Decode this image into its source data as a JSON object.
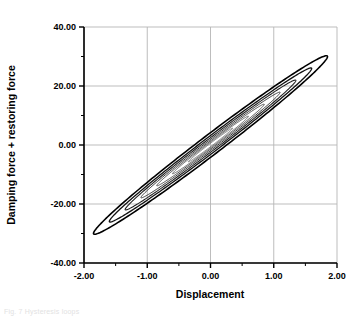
{
  "figure": {
    "background_color": "#ffffff",
    "frame_color": "#000000",
    "grid_color": "#b5b5b5",
    "curve_color": "#000000",
    "caption_fragment": "Fig. 7  Hysteresis loops"
  },
  "chart_data": {
    "type": "line",
    "title": "",
    "xlabel": "Displacement",
    "ylabel": "Damping force + restoring force",
    "xlim": [
      -2.0,
      2.0
    ],
    "ylim": [
      -40.0,
      40.0
    ],
    "xticks": [
      -2.0,
      -1.0,
      0.0,
      1.0,
      2.0
    ],
    "xtick_labels": [
      "-2.00",
      "-1.00",
      "0.00",
      "1.00",
      "2.00"
    ],
    "yticks": [
      -40.0,
      -20.0,
      0.0,
      20.0,
      40.0
    ],
    "ytick_labels": [
      "-40.00",
      "-20.00",
      "0.00",
      "20.00",
      "40.00"
    ],
    "x_minor_tick_interval": 0.5,
    "y_minor_tick_interval": 10.0,
    "grid": true,
    "grid_axes": "both",
    "legend": null,
    "legend_position": "none",
    "annotations": [],
    "series": [
      {
        "name": "loop-1-outer",
        "type": "hysteresis-ellipse",
        "amplitude_x": 1.85,
        "amplitude_y": 30.0,
        "slope": 16.2,
        "half_width_y_at_zero": 4.2,
        "tilt_deg": 0,
        "linewidth": 1.6,
        "color": "#000000",
        "endpoints": [
          [
            -1.85,
            -30.0
          ],
          [
            1.85,
            30.0
          ]
        ]
      },
      {
        "name": "loop-2",
        "type": "hysteresis-ellipse",
        "amplitude_x": 1.6,
        "amplitude_y": 26.0,
        "slope": 16.2,
        "half_width_y_at_zero": 3.2,
        "tilt_deg": 0,
        "linewidth": 1.3,
        "color": "#111111",
        "endpoints": [
          [
            -1.6,
            -26.0
          ],
          [
            1.6,
            26.0
          ]
        ]
      },
      {
        "name": "loop-3",
        "type": "hysteresis-ellipse",
        "amplitude_x": 1.35,
        "amplitude_y": 22.0,
        "slope": 16.2,
        "half_width_y_at_zero": 2.5,
        "tilt_deg": 0,
        "linewidth": 1.1,
        "color": "#222222",
        "endpoints": [
          [
            -1.35,
            -22.0
          ],
          [
            1.35,
            22.0
          ]
        ]
      },
      {
        "name": "loop-4",
        "type": "hysteresis-ellipse",
        "amplitude_x": 1.1,
        "amplitude_y": 18.0,
        "slope": 16.2,
        "half_width_y_at_zero": 1.9,
        "tilt_deg": 0,
        "linewidth": 1.0,
        "color": "#333333",
        "endpoints": [
          [
            -1.1,
            -18.0
          ],
          [
            1.1,
            18.0
          ]
        ]
      },
      {
        "name": "loop-5",
        "type": "hysteresis-ellipse",
        "amplitude_x": 0.85,
        "amplitude_y": 14.0,
        "slope": 16.2,
        "half_width_y_at_zero": 1.4,
        "tilt_deg": 0,
        "linewidth": 0.9,
        "color": "#3a3a3a",
        "endpoints": [
          [
            -0.85,
            -14.0
          ],
          [
            0.85,
            14.0
          ]
        ]
      },
      {
        "name": "loop-6",
        "type": "hysteresis-ellipse",
        "amplitude_x": 0.6,
        "amplitude_y": 9.8,
        "slope": 16.2,
        "half_width_y_at_zero": 1.0,
        "tilt_deg": 0,
        "linewidth": 0.8,
        "color": "#444444",
        "endpoints": [
          [
            -0.6,
            -9.8
          ],
          [
            0.6,
            9.8
          ]
        ]
      },
      {
        "name": "loop-7-inner",
        "type": "hysteresis-ellipse",
        "amplitude_x": 0.35,
        "amplitude_y": 5.7,
        "slope": 16.2,
        "half_width_y_at_zero": 0.6,
        "tilt_deg": 0,
        "linewidth": 0.7,
        "color": "#4a4a4a",
        "endpoints": [
          [
            -0.35,
            -5.7
          ],
          [
            0.35,
            5.7
          ]
        ]
      }
    ]
  }
}
